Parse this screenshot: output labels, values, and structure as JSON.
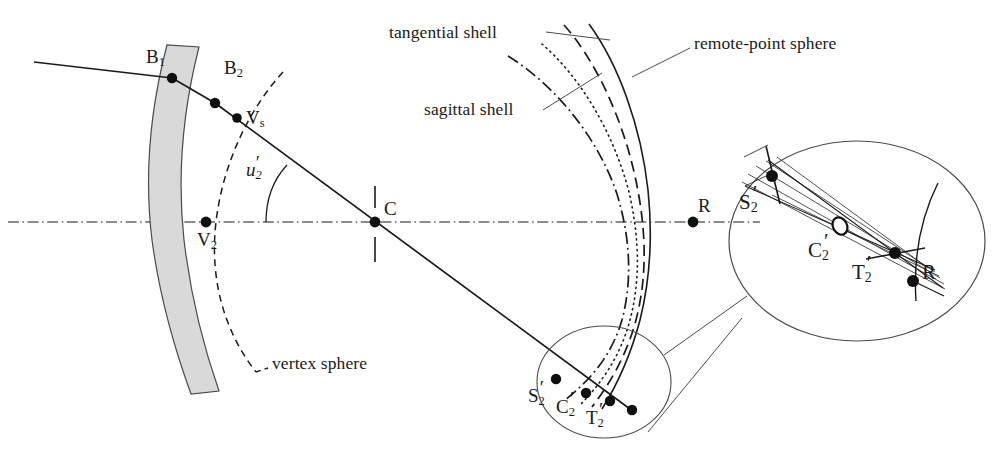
{
  "figure": {
    "type": "optical-ray-diagram",
    "background_color": "#ffffff",
    "line_color": "#1a1a1a",
    "lens_fill_color": "#d9d9d9",
    "thin_line_color": "#555555"
  },
  "annotations": {
    "tangential_shell": "tangential shell",
    "sagittal_shell": "sagittal shell",
    "remote_point_sphere": "remote-point sphere",
    "vertex_sphere": "vertex sphere"
  },
  "points": {
    "b1": "B",
    "b1_sub": "1",
    "b2": "B",
    "b2_sub": "2",
    "vs": "V",
    "vs_sub": "s",
    "v2": "V",
    "v2_sub": "2",
    "c": "C",
    "r": "R",
    "r_inset": "R",
    "s2p": "S",
    "s2p_sub": "2",
    "c2p": "C",
    "c2p_sub": "2",
    "t2p": "T",
    "t2p_sub": "2",
    "s2p_inset": "S",
    "s2p_inset_sub": "2",
    "c2p_inset": "C",
    "c2p_inset_sub": "2",
    "t2p_inset": "T",
    "t2p_inset_sub": "2",
    "prime": "′"
  },
  "angles": {
    "u2_prime_symbol": "u",
    "u2_prime_sub": "2",
    "u2_prime_mark": "′"
  },
  "curves": {
    "remote_point_sphere_style": "solid",
    "tangential_shell_style": "dashed",
    "petzval_surface_style": "dotted",
    "sagittal_shell_style": "dashdot",
    "vertex_sphere_style": "dashed",
    "optical_axis_style": "dashdot"
  }
}
